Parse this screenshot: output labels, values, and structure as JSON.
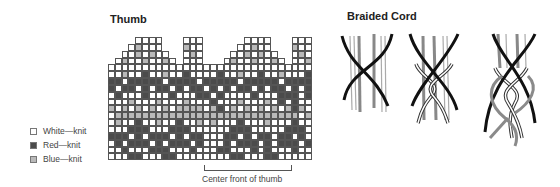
{
  "thumb": {
    "title": "Thumb",
    "center_label": "Center front of thumb",
    "columns": 30,
    "rows": 18,
    "pattern": [
      "....WWWW...WWW......WWWW...WWW",
      "...WBWWW...BWW.....WWBWW...BWW",
      "..WWBWBWW..WBW....WWBWBWW..WBW",
      ".WBWWBWWBW.WWW...WBWWBWWBW.WWB",
      "WWWWWWWWWWWWWWWWWWWWWWWWWWWWWW",
      "WWBWWRWWBWWRWWWWRWWBWWRWWBWWWR",
      "RRWRRRRRWRRRRWRRRRRWRRRRRWRRRR",
      "RWRRWRWRRWRWRRWRWRWRRWRWRRWRWR",
      "WRWWWRWWWRWWWRRWRWWWWRWWWRRRWR",
      "WWWBWWWBWWWBWWWRWWWBWWWBWRWRWW",
      "BWBWBWBWBWBBBBWBRWBWBWBWBWBRBW",
      "WBBBBBBBBBBBBBBBBBBBBBBBBBBBWB",
      "WBWWRWWBWWRWWBWBWWWRWWWBWWWRWW",
      "WWWRRRWWWRRRWWWWWWRRRWWWWWRRRW",
      "RRRWRWRRRWRWRRWWWRRWRWRRWRRWRW",
      "WRWRRRWRWRRRWRWWWRWRRRWRWRRRWR",
      "WWRWWWRRRWWWRWWWRRWWWRWRWWWRWW",
      "WWWRRWWWRRWWWWWWWWRRWWWRRWWWWW"
    ]
  },
  "legend": {
    "items": [
      {
        "label": "White—knit",
        "color": "#ffffff"
      },
      {
        "label": "Red—knit",
        "color": "#4b4b4b"
      },
      {
        "label": "Blue—knit",
        "color": "#b9b9b9"
      }
    ]
  },
  "cord": {
    "title": "Braided Cord",
    "steps": 3
  },
  "colors": {
    "red_knit": "#4b4b4b",
    "blue_knit": "#b9b9b9",
    "white_knit": "#ffffff",
    "grid_line": "#555555"
  }
}
